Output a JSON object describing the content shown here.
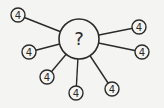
{
  "center": {
    "label": "?",
    "x": 79,
    "y": 39,
    "r": 20
  },
  "nodes": [
    {
      "label": "4",
      "x": 18,
      "y": 15
    },
    {
      "label": "4",
      "x": 29,
      "y": 52
    },
    {
      "label": "4",
      "x": 47,
      "y": 77
    },
    {
      "label": "4",
      "x": 76,
      "y": 93
    },
    {
      "label": "4",
      "x": 112,
      "y": 89
    },
    {
      "label": "4",
      "x": 142,
      "y": 52
    },
    {
      "label": "4",
      "x": 139,
      "y": 27
    }
  ],
  "colors": {
    "stroke": "#2a2a2a",
    "background": "#f4f4f2"
  }
}
